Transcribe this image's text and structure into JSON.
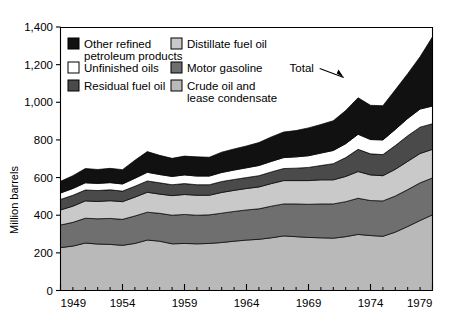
{
  "chart_data": {
    "type": "area",
    "stacked": true,
    "title": "",
    "xlabel": "",
    "ylabel": "Million barrels",
    "xlim": [
      1949,
      1979
    ],
    "ylim": [
      0,
      1400
    ],
    "yticks": [
      0,
      200,
      400,
      600,
      800,
      1000,
      1200,
      1400
    ],
    "ytick_labels": [
      "0",
      "200",
      "400",
      "600",
      "800",
      "1,000",
      "1,200",
      "1,400"
    ],
    "xticks": [
      1949,
      1954,
      1959,
      1964,
      1969,
      1974,
      1979
    ],
    "xtick_labels": [
      "1949",
      "1954",
      "1959",
      "1964",
      "1969",
      "1974",
      "1979"
    ],
    "x_minor_step": 1,
    "grid": false,
    "legend_position": "inside-top-left",
    "x": [
      1949,
      1950,
      1951,
      1952,
      1953,
      1954,
      1955,
      1956,
      1957,
      1958,
      1959,
      1960,
      1961,
      1962,
      1963,
      1964,
      1965,
      1966,
      1967,
      1968,
      1969,
      1970,
      1971,
      1972,
      1973,
      1974,
      1975,
      1976,
      1977,
      1978,
      1979
    ],
    "series": [
      {
        "name": "Crude oil and lease condensate",
        "color": "#b9b9b9",
        "values": [
          228,
          236,
          252,
          247,
          245,
          240,
          250,
          268,
          262,
          248,
          250,
          248,
          250,
          255,
          262,
          268,
          272,
          280,
          290,
          286,
          282,
          280,
          278,
          286,
          298,
          292,
          288,
          310,
          340,
          372,
          402
        ]
      },
      {
        "name": "Motor gasoline",
        "color": "#6f6f6f",
        "values": [
          120,
          126,
          132,
          134,
          138,
          138,
          146,
          148,
          148,
          152,
          154,
          152,
          152,
          156,
          158,
          160,
          162,
          168,
          170,
          174,
          176,
          180,
          182,
          186,
          192,
          186,
          188,
          192,
          196,
          200,
          196
        ]
      },
      {
        "name": "Distillate fuel oil",
        "color": "#c9c9c9",
        "values": [
          80,
          86,
          92,
          92,
          94,
          94,
          100,
          106,
          102,
          104,
          106,
          106,
          104,
          110,
          112,
          114,
          116,
          120,
          124,
          124,
          126,
          128,
          128,
          134,
          142,
          136,
          134,
          142,
          150,
          156,
          152
        ]
      },
      {
        "name": "Residual fuel oil",
        "color": "#4a4a4a",
        "values": [
          56,
          58,
          58,
          58,
          58,
          56,
          58,
          60,
          60,
          58,
          58,
          56,
          56,
          58,
          58,
          58,
          60,
          62,
          64,
          66,
          70,
          76,
          86,
          100,
          118,
          112,
          112,
          126,
          136,
          140,
          136
        ]
      },
      {
        "name": "Unfinished oils",
        "color": "#ffffff",
        "values": [
          34,
          36,
          38,
          38,
          38,
          38,
          42,
          46,
          44,
          44,
          46,
          46,
          46,
          48,
          50,
          52,
          54,
          56,
          58,
          60,
          62,
          66,
          70,
          74,
          80,
          76,
          78,
          86,
          92,
          96,
          94
        ]
      },
      {
        "name": "Other refined petroleum products",
        "color": "#111111",
        "values": [
          62,
          68,
          76,
          74,
          76,
          76,
          96,
          110,
          102,
          96,
          100,
          102,
          100,
          108,
          112,
          116,
          122,
          130,
          136,
          140,
          148,
          152,
          158,
          176,
          194,
          182,
          182,
          210,
          238,
          278,
          368
        ]
      }
    ],
    "totals": [
      580,
      610,
      648,
      643,
      649,
      642,
      692,
      738,
      718,
      702,
      714,
      710,
      708,
      735,
      752,
      768,
      786,
      816,
      842,
      850,
      864,
      882,
      902,
      956,
      1024,
      984,
      982,
      1066,
      1152,
      1242,
      1348
    ],
    "annotations": [
      {
        "name": "total-annotation",
        "text": "Total",
        "x": 1972,
        "y": 1180
      }
    ]
  },
  "legend": {
    "items": [
      {
        "label_line1": "Other refined",
        "label_line2": "petroleum products",
        "color": "#111111"
      },
      {
        "label_line1": "Unfinished oils",
        "label_line2": "",
        "color": "#ffffff"
      },
      {
        "label_line1": "Residual fuel oil",
        "label_line2": "",
        "color": "#4a4a4a"
      },
      {
        "label_line1": "Distillate fuel oil",
        "label_line2": "",
        "color": "#c9c9c9"
      },
      {
        "label_line1": "Motor gasoline",
        "label_line2": "",
        "color": "#6f6f6f"
      },
      {
        "label_line1": "Crude oil and",
        "label_line2": "lease condensate",
        "color": "#b9b9b9"
      }
    ]
  }
}
